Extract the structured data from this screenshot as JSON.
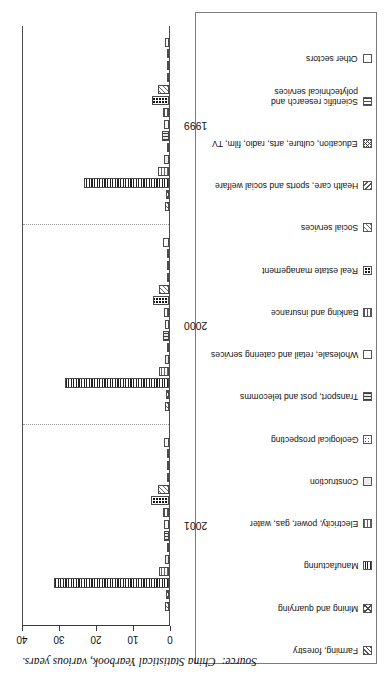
{
  "figure": {
    "source_prefix": "Source:",
    "source_text": "China Statistical Yearbook, various years."
  },
  "legend": {
    "items": [
      {
        "label": "Other sectors",
        "pattern": "empty"
      },
      {
        "label": "Scientific research and\npolytechnical services",
        "pattern": "vlines"
      },
      {
        "label": "Education, culture, arts, radio, film, TV",
        "pattern": "crosshatch"
      },
      {
        "label": "Health care, sports and social welfare",
        "pattern": "diag"
      },
      {
        "label": "Social services",
        "pattern": "diag2"
      },
      {
        "label": "Real estate management",
        "pattern": "solidblk"
      },
      {
        "label": "Banking and insurance",
        "pattern": "hlines"
      },
      {
        "label": "Wholesale, retail and catering services",
        "pattern": "light"
      },
      {
        "label": "Transport, post and telecomms",
        "pattern": "vdark"
      },
      {
        "label": "Geological prospecting",
        "pattern": "dot"
      },
      {
        "label": "Construction",
        "pattern": "grey"
      },
      {
        "label": "Electricity, power, gas, water",
        "pattern": "grid"
      },
      {
        "label": "Manufacturing",
        "pattern": "grid-dark"
      },
      {
        "label": "Mining and quarrying",
        "pattern": "xhatch"
      },
      {
        "label": "Farming, forestry",
        "pattern": "zig"
      }
    ]
  },
  "chart_data": {
    "type": "bar",
    "title": "",
    "xlabel": "",
    "ylabel": "",
    "orientation": "grouped-vertical",
    "categories": [
      "2001",
      "2000",
      "1999"
    ],
    "ylim": [
      0,
      40
    ],
    "yticks": [
      0,
      10,
      20,
      30,
      40
    ],
    "ytick_labels": [
      "0",
      "10",
      "20",
      "30",
      "40"
    ],
    "grid": false,
    "group_dividers": true,
    "legend_position": "separate-box-above",
    "series": [
      {
        "name": "Farming, forestry",
        "pattern": "zig",
        "values": [
          1.2,
          1.1,
          1.2
        ]
      },
      {
        "name": "Mining and quarrying",
        "pattern": "xhatch",
        "values": [
          0.9,
          0.8,
          0.9
        ]
      },
      {
        "name": "Manufacturing",
        "pattern": "grid-dark",
        "values": [
          31.0,
          28.0,
          23.0
        ]
      },
      {
        "name": "Electricity, power, gas, water",
        "pattern": "grid",
        "values": [
          2.8,
          2.6,
          3.0
        ]
      },
      {
        "name": "Construction",
        "pattern": "grey",
        "values": [
          1.0,
          1.1,
          1.3
        ]
      },
      {
        "name": "Geological prospecting",
        "pattern": "dot",
        "values": [
          0.3,
          0.3,
          0.3
        ]
      },
      {
        "name": "Transport, post and telecomms",
        "pattern": "vdark",
        "values": [
          1.4,
          1.5,
          1.8
        ]
      },
      {
        "name": "Wholesale, retail and catering services",
        "pattern": "light",
        "values": [
          1.3,
          1.2,
          1.4
        ]
      },
      {
        "name": "Banking and insurance",
        "pattern": "hlines",
        "values": [
          1.6,
          1.3,
          1.5
        ]
      },
      {
        "name": "Real estate management",
        "pattern": "solidblk",
        "values": [
          5.0,
          4.3,
          4.6
        ]
      },
      {
        "name": "Social services",
        "pattern": "diag2",
        "values": [
          3.1,
          2.6,
          2.9
        ]
      },
      {
        "name": "Health care, sports and social welfare",
        "pattern": "diag",
        "values": [
          0.3,
          0.3,
          0.3
        ]
      },
      {
        "name": "Education, culture, arts, radio, film, TV",
        "pattern": "crosshatch",
        "values": [
          0.3,
          0.3,
          0.3
        ]
      },
      {
        "name": "Scientific research and polytechnical services",
        "pattern": "vlines",
        "values": [
          0.3,
          0.3,
          0.3
        ]
      },
      {
        "name": "Other sectors",
        "pattern": "empty",
        "values": [
          1.4,
          1.5,
          1.0
        ]
      }
    ]
  }
}
